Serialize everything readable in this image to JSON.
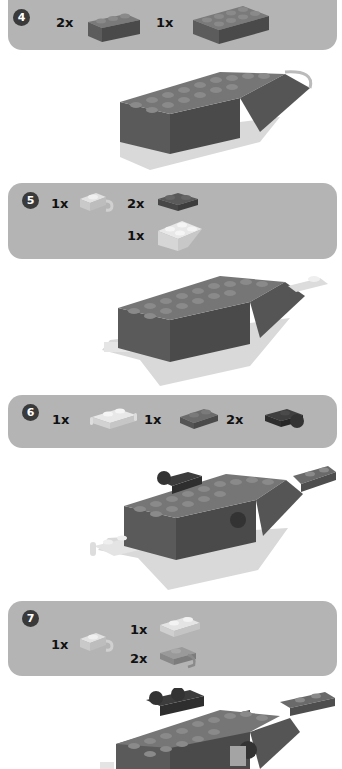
{
  "steps": [
    {
      "number": "4",
      "parts": [
        {
          "qty": "2x",
          "name": "dark-gray-brick-1x3"
        },
        {
          "qty": "1x",
          "name": "dark-gray-brick-2x4"
        }
      ]
    },
    {
      "number": "5",
      "parts": [
        {
          "qty": "1x",
          "name": "light-gray-plate-clip"
        },
        {
          "qty": "2x",
          "name": "dark-gray-plate-2x2-corner"
        },
        {
          "qty": "1x",
          "name": "light-gray-inverted-slope-2x2"
        }
      ]
    },
    {
      "number": "6",
      "parts": [
        {
          "qty": "1x",
          "name": "light-gray-plate-with-handles"
        },
        {
          "qty": "1x",
          "name": "dark-gray-plate-1x2"
        },
        {
          "qty": "2x",
          "name": "black-plate-with-ball"
        }
      ]
    },
    {
      "number": "7",
      "parts": [
        {
          "qty": "1x",
          "name": "light-gray-plate-clip"
        },
        {
          "qty": "1x",
          "name": "light-gray-plate-1x2"
        },
        {
          "qty": "2x",
          "name": "gray-plate-with-socket"
        }
      ]
    }
  ],
  "colors": {
    "panel": "#b4b4b4",
    "badge": "#3a3a3a",
    "brick_dark": "#6b6b6b",
    "brick_side": "#4e4e4e",
    "brick_light": "#d8d8d8"
  }
}
